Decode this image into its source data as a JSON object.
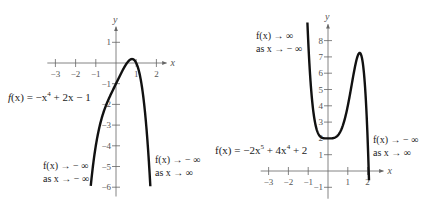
{
  "chart_data": [
    {
      "type": "line",
      "title": "",
      "function_label": "f(x) = −x⁴ + 2x − 1",
      "expression": "-x^4 + 2x - 1",
      "xlabel": "x",
      "ylabel": "y",
      "xlim": [
        -3.4,
        2.5
      ],
      "ylim": [
        -6.3,
        1.8
      ],
      "x_ticks": [
        -3,
        -2,
        -1,
        1,
        2
      ],
      "y_ticks": [
        1,
        -1,
        -2,
        -3,
        -4,
        -5,
        -6
      ],
      "x_tick_labels": [
        "−3",
        "−2",
        "−1",
        "1",
        "2"
      ],
      "y_tick_labels": [
        "1",
        "−1",
        "−2",
        "−3",
        "−4",
        "−5",
        "−6"
      ],
      "grid": false,
      "series": [
        {
          "name": "f(x) = −x⁴ + 2x − 1",
          "x": [
            -1.25,
            -1.0,
            -0.75,
            -0.5,
            -0.25,
            0,
            0.25,
            0.5,
            0.79,
            1.0,
            1.25,
            1.5,
            1.7
          ],
          "y": [
            -5.94,
            -4.0,
            -2.82,
            -2.06,
            -1.5,
            -1.0,
            -0.5,
            -0.06,
            0.19,
            0.0,
            -1.94,
            -2.06,
            -5.95
          ]
        }
      ],
      "annotations": [
        {
          "line1": "f(x) → −∞",
          "line2": "as x → −∞",
          "position": "bottom-left"
        },
        {
          "line1": "f(x) → −∞",
          "line2": "as x → ∞",
          "position": "bottom-right"
        }
      ]
    },
    {
      "type": "line",
      "title": "",
      "function_label": "f(x) = −2x⁵ + 4x⁴ + 2",
      "expression": "-2x^5 + 4x^4 + 2",
      "xlabel": "x",
      "ylabel": "y",
      "xlim": [
        -3.4,
        2.8
      ],
      "ylim": [
        -1.6,
        9
      ],
      "x_ticks": [
        -3,
        -2,
        -1,
        1,
        2
      ],
      "y_ticks": [
        8,
        7,
        6,
        5,
        4,
        3,
        2,
        1,
        -1
      ],
      "x_tick_labels": [
        "−3",
        "−2",
        "−1",
        "1",
        "2"
      ],
      "y_tick_labels": [
        "8",
        "7",
        "6",
        "5",
        "4",
        "3",
        "2",
        "1",
        "−1"
      ],
      "grid": false,
      "series": [
        {
          "name": "f(x) = −2x⁵ + 4x⁴ + 2",
          "x": [
            -1.04,
            -1.0,
            -0.75,
            -0.5,
            -0.25,
            0,
            0.25,
            0.5,
            1.0,
            1.25,
            1.6,
            1.8,
            2.0,
            2.07
          ],
          "y": [
            8.7,
            8.0,
            4.75,
            2.31,
            2.02,
            2.0,
            2.01,
            2.19,
            4.0,
            5.88,
            7.24,
            6.3,
            2.0,
            -1.0
          ]
        }
      ],
      "annotations": [
        {
          "line1": "f(x) → ∞",
          "line2": "as x → −∞",
          "position": "top-left"
        },
        {
          "line1": "f(x) → −∞",
          "line2": "as x → ∞",
          "position": "right"
        }
      ]
    }
  ],
  "graphs": {
    "left": {
      "equation": {
        "lhs": "f",
        "x": "(x)",
        "rhs": " = −x",
        "exp": "4",
        "tail": " + 2x − 1"
      },
      "ann_bl": {
        "l1": "f(x) → − ∞",
        "l2": "as x → − ∞"
      },
      "ann_br": {
        "l1": "f(x) → − ∞",
        "l2": "as x → ∞"
      }
    },
    "right": {
      "equation": {
        "a": "f(x) = −2x",
        "e1": "5",
        "b": " + 4x",
        "e2": "4",
        "c": " + 2"
      },
      "ann_tl": {
        "l1": "f(x) → ∞",
        "l2": "as x → − ∞"
      },
      "ann_r": {
        "l1": "f(x) → − ∞",
        "l2": "as x → ∞"
      }
    }
  },
  "colors": {
    "axis": "#666666",
    "curve": "#111111",
    "text": "#222222"
  }
}
